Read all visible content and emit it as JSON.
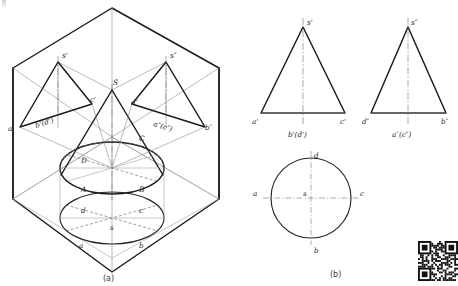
{
  "figure": {
    "captions": {
      "left": "(a)",
      "right": "(b)"
    }
  },
  "panel_a": {
    "name": "axonometric-projection-box",
    "caption": "(a)",
    "labels": {
      "apex_space": "S",
      "apex_front": "s'",
      "apex_side": "s″",
      "front_left": "a'",
      "front_center": "b'(d')",
      "front_right": "c'",
      "side_left": "d″",
      "side_center": "a″(c″)",
      "side_right": "b″",
      "space_D": "D",
      "space_C": "C",
      "space_A": "A",
      "space_B": "B",
      "top_d": "d",
      "top_c": "c",
      "top_s": "s",
      "top_a": "a",
      "top_b": "b"
    }
  },
  "panel_b": {
    "name": "three-view-orthographic",
    "caption": "(b)",
    "front_view": {
      "name": "front-view-triangle",
      "apex": "s'",
      "base_left": "a'",
      "base_right": "c'",
      "base_center": "b'(d')"
    },
    "side_view": {
      "name": "side-view-triangle",
      "apex": "s″",
      "base_left": "d″",
      "base_right": "b″",
      "base_center": "a″(c″)"
    },
    "top_view": {
      "name": "top-view-circle",
      "top": "d",
      "bottom": "b",
      "left": "a",
      "right": "c",
      "center": "s"
    }
  },
  "colors": {
    "outline": "#1a1a1a",
    "construction": "#8c8c8c",
    "hidden": "#6a6a6a",
    "centerline": "#6f6f6f",
    "background": "#ffffff",
    "text": "#2a2a2a"
  },
  "qr_code": {
    "name": "qr-code",
    "present": true
  }
}
